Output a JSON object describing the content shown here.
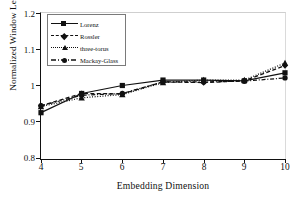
{
  "chart_data": {
    "type": "line",
    "title": "",
    "xlabel": "Embedding Dimension",
    "ylabel": "Normalized Window Length",
    "x": [
      4,
      5,
      6,
      7,
      8,
      9,
      10
    ],
    "xlim": [
      4,
      10
    ],
    "ylim": [
      0.8,
      1.2
    ],
    "xticks": [
      "4",
      "5",
      "6",
      "7",
      "8",
      "9",
      "10"
    ],
    "yticks": [
      "0.8",
      "0.9",
      "1",
      "1.1",
      "1.2"
    ],
    "grid": false,
    "legend_position": "upper-left",
    "series": [
      {
        "name": "Lorenz",
        "marker": "square",
        "line_style": "solid",
        "color": "#111111",
        "values": [
          0.925,
          0.978,
          1.0,
          1.015,
          1.015,
          1.013,
          1.035
        ]
      },
      {
        "name": "Rossler",
        "marker": "diamond",
        "line_style": "dashed",
        "color": "#111111",
        "values": [
          0.944,
          0.978,
          0.977,
          1.01,
          1.008,
          1.013,
          1.055
        ]
      },
      {
        "name": "three-torus",
        "marker": "triangle",
        "line_style": "dotted",
        "color": "#111111",
        "values": [
          0.942,
          0.966,
          0.975,
          1.008,
          1.015,
          1.015,
          1.062
        ]
      },
      {
        "name": "Mackay-Glass",
        "marker": "circle",
        "line_style": "dash-dot",
        "color": "#111111",
        "values": [
          0.944,
          0.973,
          0.978,
          1.01,
          1.01,
          1.012,
          1.021
        ]
      }
    ]
  },
  "axes": {
    "y_title": "Normalized Window Length",
    "x_title": "Embedding Dimension",
    "y_labels": [
      "1.2",
      "1.1",
      "1",
      "0.9",
      "0.8"
    ],
    "x_labels": [
      "4",
      "5",
      "6",
      "7",
      "8",
      "9",
      "10"
    ]
  },
  "legend": {
    "items": [
      {
        "label": "Lorenz"
      },
      {
        "label": "Rossler"
      },
      {
        "label": "three-torus"
      },
      {
        "label": "Mackay-Glass"
      }
    ]
  }
}
